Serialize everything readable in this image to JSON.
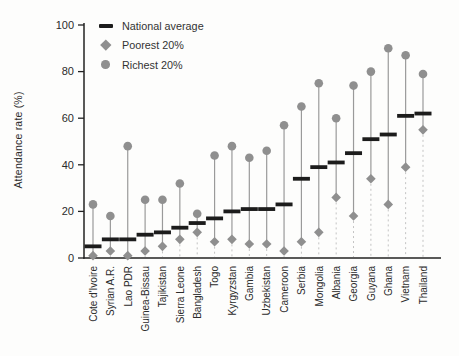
{
  "chart_data": {
    "type": "scatter",
    "title": "",
    "ylabel": "Attendance rate (%)",
    "xlabel": "",
    "ylim": [
      0,
      100
    ],
    "yticks": [
      0,
      20,
      40,
      60,
      80,
      100
    ],
    "grid": false,
    "legend_position": "top-left-inside",
    "categories": [
      "Cote d'Ivoire",
      "Syrian A.R.",
      "Lao PDR",
      "Guinea-Bissau",
      "Tajikistan",
      "Sierra Leone",
      "Bangladesh",
      "Togo",
      "Kyrgyzstan",
      "Gambia",
      "Uzbekistan",
      "Cameroon",
      "Serbia",
      "Mongolia",
      "Albania",
      "Georgia",
      "Guyana",
      "Ghana",
      "Vietnam",
      "Thailand"
    ],
    "series": [
      {
        "name": "National average",
        "marker": "dash",
        "color": "#1c1c1c",
        "values": [
          5,
          8,
          8,
          10,
          11,
          13,
          15,
          17,
          20,
          21,
          21,
          23,
          34,
          39,
          41,
          45,
          51,
          53,
          61,
          62
        ]
      },
      {
        "name": "Poorest 20%",
        "marker": "diamond",
        "color": "#8f8f8f",
        "values": [
          1,
          3,
          1,
          3,
          5,
          8,
          11,
          7,
          8,
          6,
          6,
          3,
          7,
          11,
          26,
          18,
          34,
          23,
          39,
          55
        ]
      },
      {
        "name": "Richest 20%",
        "marker": "circle",
        "color": "#8f8f8f",
        "values": [
          23,
          18,
          48,
          25,
          25,
          32,
          19,
          44,
          48,
          43,
          46,
          57,
          65,
          75,
          60,
          74,
          80,
          90,
          87,
          79
        ]
      }
    ],
    "colors": {
      "national_dash": "#1c1c1c",
      "marker_gray": "#8f8f8f",
      "stem": "#9a9a9a",
      "stem_dotted": "#c3c3c3",
      "axis": "#222222",
      "text": "#2b2b2b"
    }
  }
}
